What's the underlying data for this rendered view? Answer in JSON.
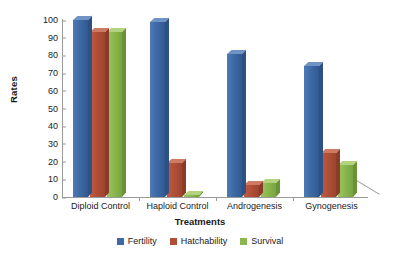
{
  "chart_data": {
    "type": "bar",
    "title": "",
    "xlabel": "Treatments",
    "ylabel": "Rates",
    "categories": [
      "Diploid Control",
      "Haploid Control",
      "Androgenesis",
      "Gynogenesis"
    ],
    "series": [
      {
        "name": "Fertility",
        "color": "#3d6aa6",
        "values": [
          100,
          99,
          81,
          74
        ]
      },
      {
        "name": "Hatchability",
        "color": "#b14f37",
        "values": [
          93,
          19,
          7,
          25
        ]
      },
      {
        "name": "Survival",
        "color": "#8bb84e",
        "values": [
          93,
          1,
          8,
          18
        ]
      }
    ],
    "ylim": [
      0,
      100
    ],
    "ytick_step": 10,
    "yticks": [
      "100",
      "90",
      "80",
      "70",
      "60",
      "50",
      "40",
      "30",
      "20",
      "10",
      "0"
    ],
    "grid": false,
    "legend_position": "bottom",
    "style": "3d-column"
  }
}
